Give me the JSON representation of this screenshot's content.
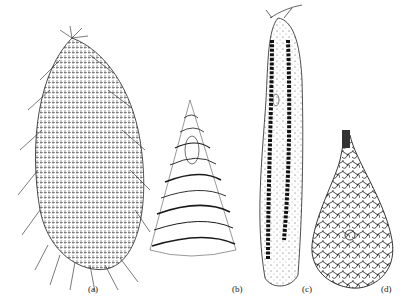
{
  "figure": {
    "panels": [
      {
        "id": "a",
        "label": "(a)",
        "description": "ovoid ciliate covered in dense rows of cilia with long trailing cilia"
      },
      {
        "id": "b",
        "label": "(b)",
        "description": "conical organism with spiral striations and an internal vacuole near apex"
      },
      {
        "id": "c",
        "label": "(c)",
        "description": "elongated ciliate with long beaded macronucleus"
      },
      {
        "id": "d",
        "label": "(d)",
        "description": "flask-shaped organism with reticulate internal pattern and short neck"
      }
    ],
    "colors": {
      "ink": "#1a1a1a",
      "background": "#ffffff"
    }
  }
}
